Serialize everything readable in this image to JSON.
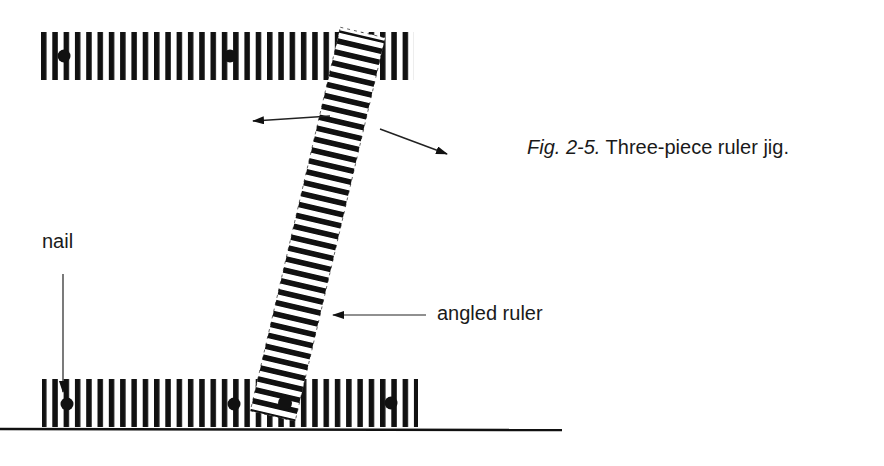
{
  "caption": {
    "figure_number": "Fig. 2-5.",
    "title": "Three-piece ruler jig."
  },
  "labels": {
    "nail": "nail",
    "angled_ruler": "angled ruler"
  },
  "colors": {
    "ink": "#111111",
    "background": "#ffffff"
  },
  "parts": [
    {
      "name": "top-ruler",
      "orientation": "horizontal",
      "nails": 2
    },
    {
      "name": "angled-ruler",
      "orientation": "angled",
      "nails": 1
    },
    {
      "name": "bottom-ruler",
      "orientation": "horizontal",
      "nails": 3
    }
  ]
}
